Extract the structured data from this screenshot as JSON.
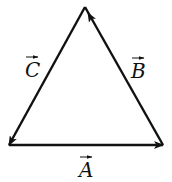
{
  "diagram": {
    "stroke_color": "#111111",
    "vectors": [
      {
        "name": "A",
        "label": "A",
        "from": "bottom-left",
        "to": "bottom-right"
      },
      {
        "name": "B",
        "label": "B",
        "from": "bottom-right",
        "to": "top"
      },
      {
        "name": "C",
        "label": "C",
        "from": "top",
        "to": "bottom-left"
      }
    ]
  }
}
